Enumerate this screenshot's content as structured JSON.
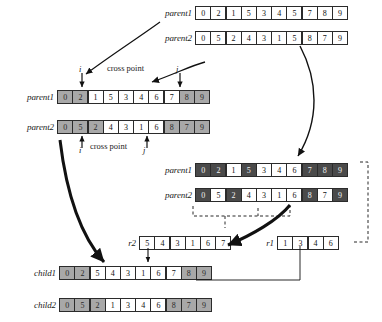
{
  "diagram": {
    "labels": {
      "parent1": "parent1",
      "parent2": "parent2",
      "child1": "child1",
      "child2": "child2",
      "r1": "r1",
      "r2": "r2",
      "cross_point": "cross point",
      "marker_i": "i",
      "marker_j": "j"
    },
    "colors": {
      "shade_light": "#a8a8a8",
      "shade_mid": "#8c8c8c",
      "shade_dark": "#4a4a4a",
      "cell_border": "#2b2b2b",
      "background": "#ffffff"
    },
    "rows": {
      "top_parent1": {
        "label": "parent1",
        "values": [
          "0",
          "2",
          "1",
          "5",
          "3",
          "4",
          "5",
          "7",
          "8",
          "9"
        ],
        "shades": [
          "none",
          "none",
          "none",
          "none",
          "none",
          "none",
          "none",
          "none",
          "none",
          "none"
        ]
      },
      "top_parent2": {
        "label": "parent2",
        "values": [
          "0",
          "5",
          "2",
          "4",
          "3",
          "1",
          "5",
          "8",
          "7",
          "9"
        ],
        "shades": [
          "none",
          "none",
          "none",
          "none",
          "none",
          "none",
          "none",
          "none",
          "none",
          "none"
        ]
      },
      "mid_parent1": {
        "label": "parent1",
        "values": [
          "0",
          "2",
          "1",
          "5",
          "3",
          "4",
          "6",
          "7",
          "8",
          "9"
        ],
        "shades": [
          "light",
          "light",
          "none",
          "none",
          "none",
          "none",
          "none",
          "none",
          "light",
          "light"
        ]
      },
      "mid_parent2": {
        "label": "parent2",
        "values": [
          "0",
          "5",
          "2",
          "4",
          "3",
          "1",
          "6",
          "8",
          "7",
          "9"
        ],
        "shades": [
          "light",
          "light",
          "light",
          "none",
          "none",
          "none",
          "none",
          "light",
          "light",
          "light"
        ]
      },
      "right_parent1": {
        "label": "parent1",
        "values": [
          "0",
          "2",
          "1",
          "5",
          "3",
          "4",
          "6",
          "7",
          "8",
          "9"
        ],
        "shades": [
          "dark",
          "dark",
          "none",
          "dark",
          "none",
          "none",
          "none",
          "dark",
          "dark",
          "dark"
        ]
      },
      "right_parent2": {
        "label": "parent2",
        "values": [
          "0",
          "5",
          "2",
          "4",
          "3",
          "1",
          "6",
          "8",
          "7",
          "9"
        ],
        "shades": [
          "dark",
          "none",
          "dark",
          "none",
          "none",
          "none",
          "none",
          "dark",
          "none",
          "dark"
        ]
      },
      "r2": {
        "label": "r2",
        "values": [
          "5",
          "4",
          "3",
          "1",
          "6",
          "7"
        ],
        "shades": [
          "none",
          "none",
          "none",
          "none",
          "none",
          "none"
        ]
      },
      "r1": {
        "label": "r1",
        "values": [
          "1",
          "3",
          "4",
          "6"
        ],
        "shades": [
          "none",
          "none",
          "none",
          "none"
        ]
      },
      "child1": {
        "label": "child1",
        "values": [
          "0",
          "2",
          "5",
          "4",
          "3",
          "1",
          "6",
          "7",
          "8",
          "9"
        ],
        "shades": [
          "light",
          "light",
          "none",
          "none",
          "none",
          "none",
          "none",
          "none",
          "light",
          "light"
        ]
      },
      "child2": {
        "label": "child2",
        "values": [
          "0",
          "5",
          "2",
          "1",
          "3",
          "4",
          "6",
          "8",
          "7",
          "9"
        ],
        "shades": [
          "light",
          "light",
          "light",
          "none",
          "none",
          "none",
          "none",
          "light",
          "light",
          "light"
        ]
      }
    },
    "annotations": {
      "upper_cross_point": "cross point",
      "upper_i": "i",
      "upper_j": "j",
      "lower_cross_point": "cross point",
      "lower_i": "i",
      "lower_j": "j"
    }
  }
}
